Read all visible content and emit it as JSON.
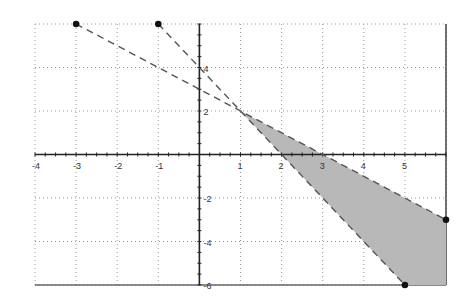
{
  "chart_data": {
    "type": "line",
    "title": "",
    "xlabel": "",
    "ylabel": "",
    "xlim": [
      -4,
      6
    ],
    "ylim": [
      -6,
      6
    ],
    "grid": true,
    "x_ticks": [
      -4,
      -3,
      -2,
      -1,
      1,
      2,
      3,
      4,
      5
    ],
    "y_ticks": [
      4,
      2,
      -2,
      -4,
      -6
    ],
    "series": [
      {
        "name": "y = -x + 3",
        "style": "dashed",
        "points": [
          [
            -3,
            6
          ],
          [
            6,
            -3
          ]
        ]
      },
      {
        "name": "y = -2x + 4",
        "style": "dashed",
        "points": [
          [
            -1,
            6
          ],
          [
            5,
            -6
          ]
        ]
      }
    ],
    "endpoints": [
      [
        -3,
        6
      ],
      [
        -1,
        6
      ],
      [
        6,
        -3
      ],
      [
        5,
        -6
      ]
    ],
    "shaded_region": {
      "description": "between the two dashed lines for x > 1",
      "vertices": [
        [
          1,
          2
        ],
        [
          6,
          -3
        ],
        [
          6,
          -6
        ],
        [
          5,
          -6
        ]
      ],
      "color": "#b8b8b8"
    },
    "intersection": [
      1,
      2
    ]
  },
  "colors": {
    "axis": "#222222",
    "grid": "#999999",
    "line": "#555555",
    "shade": "#b8b8b8"
  }
}
